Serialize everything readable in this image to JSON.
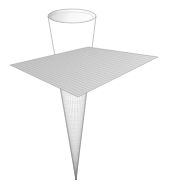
{
  "figure": {
    "title": "",
    "background_color": "#ffffff",
    "width": 170,
    "height": 191
  },
  "chart_data": {
    "type": "surface-3d",
    "title": "",
    "subtitle": "",
    "xlabel": "",
    "ylabel": "",
    "zlabel": "",
    "grid": true,
    "axes_visible": false,
    "tick_labels": [],
    "legend": [],
    "annotations": [],
    "background_color": "#ffffff",
    "projection": {
      "kind": "oblique-perspective",
      "elevation_deg": 22,
      "azimuth_deg": 35
    },
    "surfaces": [
      {
        "name": "plane",
        "label": "horizontal plane",
        "equation": "z = 0",
        "type": "mesh-quad",
        "xlim": [
          -1,
          1
        ],
        "ylim": [
          -1,
          1
        ],
        "zlim": [
          0,
          0
        ],
        "mesh_u": 26,
        "mesh_v": 26,
        "face_color": "#d2d2d2",
        "edge_color": "#b4b4b4",
        "screen_corners": [
          [
            10,
            65
          ],
          [
            88,
            47
          ],
          [
            158,
            57
          ],
          [
            78,
            97
          ]
        ],
        "shade_light": "#dedede",
        "shade_dark": "#c2c2c2"
      },
      {
        "name": "cone-upper",
        "label": "cone flaring above plane",
        "equation": "z = sqrt(x^2 + y^2)",
        "type": "mesh-cone",
        "radius_top": 24,
        "radius_waist": 0,
        "mesh_u": 40,
        "mesh_v": 16,
        "face_color": "#c8c8c8",
        "edge_color": "#a8a8a8",
        "screen_apex": [
          76,
          180
        ],
        "screen_rim_center": [
          72,
          16
        ],
        "screen_rim_rx": 24,
        "screen_rim_ry": 7,
        "shade_light": "#e6e6e6",
        "shade_dark": "#9a9a9a"
      },
      {
        "name": "cone-lower",
        "label": "cone tapering below plane to apex",
        "equation": "z = -sqrt(x^2 + y^2)",
        "type": "mesh-cone",
        "face_color": "#cfcfcf",
        "edge_color": "#aaaaaa",
        "screen_apex": [
          76,
          180
        ]
      }
    ],
    "rim": {
      "name": "cone-rim",
      "label": "open top rim ellipse",
      "fill_color": "#fbfbfb",
      "edge_color": "#c9c9c9",
      "center": [
        72,
        16
      ],
      "rx": 24,
      "ry": 7
    },
    "colors": {
      "background": "#ffffff",
      "plane_fill": "#d2d2d2",
      "plane_edge": "#b4b4b4",
      "cone_fill": "#c8c8c8",
      "cone_edge": "#a8a8a8",
      "rim_fill": "#fbfbfb",
      "highlight": "#efefef",
      "shadow": "#8f8f8f"
    }
  }
}
